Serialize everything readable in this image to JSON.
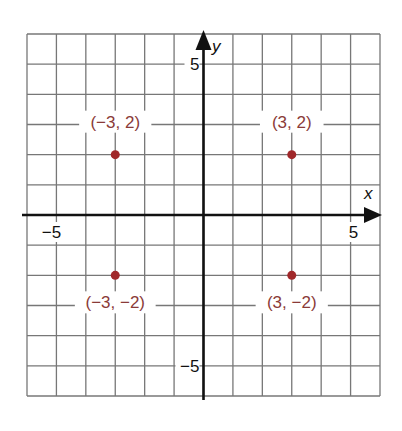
{
  "chart_data": {
    "type": "scatter",
    "title": "",
    "xlabel": "x",
    "ylabel": "y",
    "xlim": [
      -6,
      6
    ],
    "ylim": [
      -6,
      6
    ],
    "grid": true,
    "grid_step": 1,
    "tick_labels": {
      "x": [
        {
          "value": -5,
          "label": "−5"
        },
        {
          "value": 5,
          "label": "5"
        }
      ],
      "y": [
        {
          "value": 5,
          "label": "5"
        },
        {
          "value": -5,
          "label": "−5"
        }
      ]
    },
    "points": [
      {
        "x": -3,
        "y": 2,
        "label": "(−3, 2)"
      },
      {
        "x": 3,
        "y": 2,
        "label": "(3, 2)"
      },
      {
        "x": -3,
        "y": -2,
        "label": "(−3, −2)"
      },
      {
        "x": 3,
        "y": -2,
        "label": "(3, −2)"
      }
    ],
    "colors": {
      "point": "#a0282a",
      "label": "#8a3a38",
      "grid": "#777777",
      "axis": "#111111"
    }
  }
}
